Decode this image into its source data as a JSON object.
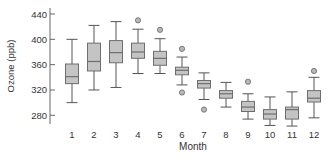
{
  "chart_data": {
    "type": "box",
    "title": "",
    "xlabel": "Month",
    "ylabel": "Ozone (ppb)",
    "ylim": [
      265,
      445
    ],
    "yticks": [
      280,
      320,
      360,
      400,
      440
    ],
    "grid": false,
    "legend": null,
    "categories": [
      "1",
      "2",
      "3",
      "4",
      "5",
      "6",
      "7",
      "8",
      "9",
      "10",
      "11",
      "12"
    ],
    "boxes": [
      {
        "month": "1",
        "whisker_low": 300,
        "q1": 330,
        "median": 341,
        "q3": 361,
        "whisker_high": 400,
        "outliers": []
      },
      {
        "month": "2",
        "whisker_low": 320,
        "q1": 350,
        "median": 365,
        "q3": 394,
        "whisker_high": 422,
        "outliers": []
      },
      {
        "month": "3",
        "whisker_low": 324,
        "q1": 363,
        "median": 379,
        "q3": 398,
        "whisker_high": 428,
        "outliers": []
      },
      {
        "month": "4",
        "whisker_low": 346,
        "q1": 370,
        "median": 380,
        "q3": 394,
        "whisker_high": 416,
        "outliers": [
          430
        ]
      },
      {
        "month": "5",
        "whisker_low": 346,
        "q1": 359,
        "median": 370,
        "q3": 381,
        "whisker_high": 401,
        "outliers": [
          415
        ]
      },
      {
        "month": "6",
        "whisker_low": 328,
        "q1": 344,
        "median": 351,
        "q3": 356,
        "whisker_high": 372,
        "outliers": [
          385,
          316
        ]
      },
      {
        "month": "7",
        "whisker_low": 305,
        "q1": 323,
        "median": 330,
        "q3": 335,
        "whisker_high": 347,
        "outliers": [
          289
        ]
      },
      {
        "month": "8",
        "whisker_low": 293,
        "q1": 307,
        "median": 314,
        "q3": 319,
        "whisker_high": 332,
        "outliers": []
      },
      {
        "month": "9",
        "whisker_low": 274,
        "q1": 286,
        "median": 293,
        "q3": 302,
        "whisker_high": 314,
        "outliers": [
          333
        ]
      },
      {
        "month": "10",
        "whisker_low": 264,
        "q1": 274,
        "median": 282,
        "q3": 289,
        "whisker_high": 309,
        "outliers": []
      },
      {
        "month": "11",
        "whisker_low": 263,
        "q1": 274,
        "median": 289,
        "q3": 293,
        "whisker_high": 317,
        "outliers": []
      },
      {
        "month": "12",
        "whisker_low": 276,
        "q1": 301,
        "median": 307,
        "q3": 319,
        "whisker_high": 340,
        "outliers": [
          350
        ]
      }
    ],
    "colors": {
      "box_fill": "#c4c4c4",
      "box_stroke": "#6e6e6e",
      "whisker": "#555555",
      "outlier_fill": "#b8b8b8",
      "axis": "#666666",
      "text": "#333333"
    }
  }
}
